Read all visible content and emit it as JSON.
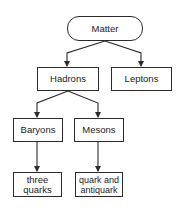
{
  "diagram": {
    "type": "tree",
    "colors": {
      "stroke": "#2a2a2a",
      "text": "#222222",
      "background": "#ffffff"
    },
    "nodes": {
      "matter": {
        "label": "Matter",
        "shape": "rounded"
      },
      "hadrons": {
        "label": "Hadrons",
        "shape": "rect"
      },
      "leptons": {
        "label": "Leptons",
        "shape": "rect"
      },
      "baryons": {
        "label": "Baryons",
        "shape": "rect"
      },
      "mesons": {
        "label": "Mesons",
        "shape": "rect"
      },
      "three_quarks": {
        "label": "three\nquarks",
        "shape": "rect"
      },
      "quark_antiquark": {
        "label": "quark and\nantiquark",
        "shape": "rect"
      }
    },
    "edges": [
      {
        "from": "Matter",
        "to": "Hadrons"
      },
      {
        "from": "Matter",
        "to": "Leptons"
      },
      {
        "from": "Hadrons",
        "to": "Baryons"
      },
      {
        "from": "Hadrons",
        "to": "Mesons"
      },
      {
        "from": "Baryons",
        "to": "three quarks"
      },
      {
        "from": "Mesons",
        "to": "quark and antiquark"
      }
    ]
  }
}
